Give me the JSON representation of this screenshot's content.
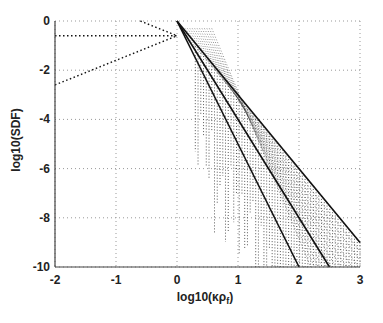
{
  "chart_data": {
    "type": "line",
    "title": "",
    "xlabel": "log10(κρ_f)",
    "ylabel": "log10(SDF)",
    "xlim": [
      -2,
      3
    ],
    "ylim": [
      -10,
      0
    ],
    "xticks": [
      -2,
      -1,
      0,
      1,
      2,
      3
    ],
    "yticks": [
      0,
      -2,
      -4,
      -6,
      -8,
      -10
    ],
    "grid": true,
    "legend": null,
    "series": [
      {
        "name": "asymptote-1",
        "style": "solid",
        "x": [
          0,
          3
        ],
        "y": [
          0,
          -9
        ]
      },
      {
        "name": "asymptote-2",
        "style": "solid",
        "x": [
          0,
          2.5
        ],
        "y": [
          0,
          -10
        ]
      },
      {
        "name": "asymptote-3",
        "style": "solid",
        "x": [
          0,
          2.0
        ],
        "y": [
          0,
          -10
        ]
      },
      {
        "name": "low-wavenumber-rising",
        "style": "dotted",
        "x": [
          -2,
          0
        ],
        "y": [
          -2.6,
          -0.6
        ]
      },
      {
        "name": "low-wavenumber-flat",
        "style": "dotted",
        "x": [
          -2,
          0
        ],
        "y": [
          -0.6,
          -0.6
        ]
      },
      {
        "name": "low-wavenumber-falling",
        "style": "dotted",
        "x": [
          -0.6,
          0
        ],
        "y": [
          0,
          -0.6
        ]
      }
    ],
    "spectra_band": {
      "description": "dense dotted oscillating spectra filling the region between the asymptotes",
      "x_start": 0.3,
      "x_end": 3.0
    }
  },
  "axes": {
    "xlabel_main": "log10(κρ",
    "xlabel_sub": "f",
    "xlabel_close": ")",
    "ylabel": "log10(SDF)",
    "xtick_labels": [
      "-2",
      "-1",
      "0",
      "1",
      "2",
      "3"
    ],
    "ytick_labels": [
      "0",
      "-2",
      "-4",
      "-6",
      "-8",
      "-10"
    ]
  }
}
